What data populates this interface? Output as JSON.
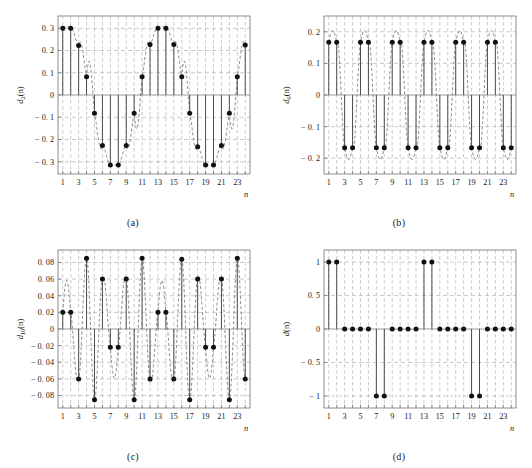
{
  "figure": {
    "background": "#ffffff",
    "stem_color": "#4d4d4d",
    "marker_color": "#111111",
    "dashed_curve_color": "#666666",
    "grid_color": "#b3b3b3",
    "axis_color": "#808080",
    "panel_count": 4
  },
  "panels": [
    {
      "id": "a",
      "caption": "(a)",
      "ylabel_base": "d",
      "ylabel_sub": "2",
      "ylabel_arg": "(n)",
      "ylabel_full": "d_2(n)",
      "xlabel": "n",
      "xticks": [
        1,
        3,
        5,
        7,
        9,
        11,
        13,
        15,
        17,
        19,
        21,
        23
      ],
      "xtick_labels": [
        "1",
        "3",
        "5",
        "7",
        "9",
        "11",
        "13",
        "15",
        "17",
        "19",
        "21",
        "23"
      ],
      "yticks": [
        0.3,
        0.2,
        0.1,
        0,
        -0.1,
        -0.2,
        -0.3
      ],
      "ytick_labels": [
        "0. 3",
        "0. 2",
        "0. 1",
        "0",
        "− 0. 1",
        "− 0. 2",
        "− 0. 3"
      ],
      "xlim": [
        0.4,
        24.6
      ],
      "ylim": [
        -0.355,
        0.355
      ],
      "grid": true
    },
    {
      "id": "b",
      "caption": "(b)",
      "ylabel_base": "d",
      "ylabel_sub": "6",
      "ylabel_arg": "(n)",
      "ylabel_full": "d_6(n)",
      "xlabel": "n",
      "xticks": [
        1,
        3,
        5,
        7,
        9,
        11,
        13,
        15,
        17,
        19,
        21,
        23
      ],
      "xtick_labels": [
        "1",
        "3",
        "5",
        "7",
        "9",
        "11",
        "13",
        "15",
        "17",
        "19",
        "21",
        "23"
      ],
      "yticks": [
        0.2,
        0.1,
        0,
        -0.1,
        -0.2
      ],
      "ytick_labels": [
        "0. 2",
        "0. 1",
        "0",
        "− 0. 1",
        "− 0. 2"
      ],
      "xlim": [
        0.4,
        24.6
      ],
      "ylim": [
        -0.25,
        0.25
      ],
      "grid": true
    },
    {
      "id": "c",
      "caption": "(c)",
      "ylabel_base": "d",
      "ylabel_sub": "10",
      "ylabel_arg": "(n)",
      "ylabel_full": "d_10(n)",
      "xlabel": "n",
      "xticks": [
        1,
        3,
        5,
        7,
        9,
        11,
        13,
        15,
        17,
        19,
        21,
        23
      ],
      "xtick_labels": [
        "1",
        "3",
        "5",
        "7",
        "9",
        "11",
        "13",
        "15",
        "17",
        "19",
        "21",
        "23"
      ],
      "yticks": [
        0.08,
        0.06,
        0.04,
        0.02,
        0,
        -0.02,
        -0.04,
        -0.06,
        -0.08
      ],
      "ytick_labels": [
        "0. 08",
        "0. 06",
        "0. 04",
        "0. 02",
        "0",
        "− 0. 02",
        "− 0. 04",
        "− 0. 06",
        "− 0. 08"
      ],
      "xlim": [
        0.4,
        24.6
      ],
      "ylim": [
        -0.095,
        0.095
      ],
      "grid": true
    },
    {
      "id": "d",
      "caption": "(d)",
      "ylabel_base": "d",
      "ylabel_sub": "",
      "ylabel_arg": "(n)",
      "ylabel_full": "d(n)",
      "xlabel": "n",
      "xticks": [
        1,
        3,
        5,
        7,
        9,
        11,
        13,
        15,
        17,
        19,
        21,
        23
      ],
      "xtick_labels": [
        "1",
        "3",
        "5",
        "7",
        "9",
        "11",
        "13",
        "15",
        "17",
        "19",
        "21",
        "23"
      ],
      "yticks": [
        1,
        0.5,
        0,
        -0.5,
        -1
      ],
      "ytick_labels": [
        "1",
        "0. 5",
        "0",
        "− 0. 5",
        "− 1"
      ],
      "xlim": [
        0.4,
        24.6
      ],
      "ylim": [
        -1.18,
        1.18
      ],
      "grid": true
    }
  ],
  "chart_data": [
    {
      "type": "scatter",
      "panel": "a",
      "title": "",
      "xlabel": "n",
      "ylabel": "d_2(n)",
      "xlim": [
        0.4,
        24.6
      ],
      "ylim": [
        -0.355,
        0.355
      ],
      "grid": true,
      "style": "stem plot with dashed continuous envelope",
      "x": [
        1,
        2,
        3,
        4,
        5,
        6,
        7,
        8,
        9,
        10,
        11,
        12,
        13,
        14,
        15,
        16,
        17,
        18,
        19,
        20,
        21,
        22,
        23,
        24
      ],
      "values": [
        0.3,
        0.3,
        0.222,
        0.082,
        -0.082,
        -0.227,
        -0.315,
        -0.315,
        -0.227,
        -0.082,
        0.082,
        0.227,
        0.3,
        0.3,
        0.227,
        0.082,
        -0.082,
        -0.232,
        -0.315,
        -0.315,
        -0.227,
        -0.082,
        0.082,
        0.225
      ],
      "envelope": {
        "description": "dashed sinusoid of period 12 through the samples",
        "amplitude": 0.315,
        "period": 12
      }
    },
    {
      "type": "scatter",
      "panel": "b",
      "title": "",
      "xlabel": "n",
      "ylabel": "d_6(n)",
      "xlim": [
        0.4,
        24.6
      ],
      "ylim": [
        -0.25,
        0.25
      ],
      "grid": true,
      "style": "stem plot with dashed continuous envelope",
      "x": [
        1,
        2,
        3,
        4,
        5,
        6,
        7,
        8,
        9,
        10,
        11,
        12,
        13,
        14,
        15,
        16,
        17,
        18,
        19,
        20,
        21,
        22,
        23,
        24
      ],
      "values": [
        0.167,
        0.167,
        -0.167,
        -0.167,
        0.167,
        0.167,
        -0.167,
        -0.167,
        0.167,
        0.167,
        -0.167,
        -0.167,
        0.167,
        0.167,
        -0.167,
        -0.167,
        0.167,
        0.167,
        -0.167,
        -0.167,
        0.167,
        0.167,
        -0.167,
        -0.167
      ],
      "envelope": {
        "description": "dashed sinusoid of period 4",
        "amplitude": 0.235,
        "period": 4
      }
    },
    {
      "type": "scatter",
      "panel": "c",
      "title": "",
      "xlabel": "n",
      "ylabel": "d_10(n)",
      "xlim": [
        0.4,
        24.6
      ],
      "ylim": [
        -0.095,
        0.095
      ],
      "grid": true,
      "style": "stem plot with dashed continuous envelope",
      "x": [
        1,
        2,
        3,
        4,
        5,
        6,
        7,
        8,
        9,
        10,
        11,
        12,
        13,
        14,
        15,
        16,
        17,
        18,
        19,
        20,
        21,
        22,
        23,
        24
      ],
      "values": [
        0.02,
        0.02,
        -0.06,
        0.085,
        -0.085,
        0.06,
        -0.022,
        -0.022,
        0.06,
        -0.085,
        0.085,
        -0.06,
        0.02,
        0.02,
        -0.06,
        0.084,
        -0.085,
        0.06,
        -0.022,
        -0.022,
        0.06,
        -0.085,
        0.085,
        -0.06
      ],
      "envelope": {
        "description": "dashed sinusoid of period 12/5",
        "amplitude": 0.09,
        "period": 2.4
      }
    },
    {
      "type": "scatter",
      "panel": "d",
      "title": "",
      "xlabel": "n",
      "ylabel": "d(n)",
      "xlim": [
        0.4,
        24.6
      ],
      "ylim": [
        -1.18,
        1.18
      ],
      "grid": true,
      "style": "stem plot, square wave samples",
      "x": [
        1,
        2,
        3,
        4,
        5,
        6,
        7,
        8,
        9,
        10,
        11,
        12,
        13,
        14,
        15,
        16,
        17,
        18,
        19,
        20,
        21,
        22,
        23,
        24
      ],
      "values": [
        1,
        1,
        0,
        0,
        0,
        0,
        -1,
        -1,
        0,
        0,
        0,
        0,
        1,
        1,
        0,
        0,
        0,
        0,
        -1,
        -1,
        0,
        0,
        0,
        0
      ],
      "envelope": null
    }
  ]
}
